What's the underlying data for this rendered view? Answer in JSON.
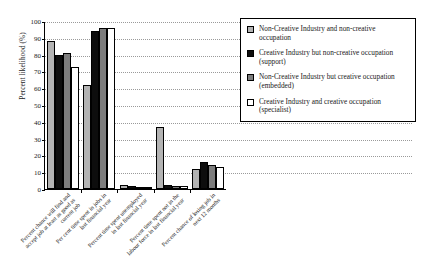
{
  "chart_data": {
    "type": "bar",
    "title": "",
    "xlabel": "",
    "ylabel": "Percent likelihood (%)",
    "ylim": [
      0,
      100
    ],
    "yticks": [
      0,
      10,
      20,
      30,
      40,
      50,
      60,
      70,
      80,
      90,
      100
    ],
    "grid": true,
    "legend_position": "right",
    "categories": [
      "Percent chance will find and accept job at least as good as current job",
      "Per cent time spent in jobs in last financial year",
      "Percent time spent unemployed in last financial year",
      "Percent time spent not in the labour force in last financial year",
      "Percent chance of losing job in next 12 months"
    ],
    "series": [
      {
        "name": "Non-Creative Industry and non-creative occupation",
        "color": "#b3b3b3",
        "values": [
          88,
          62,
          2.5,
          37,
          12
        ]
      },
      {
        "name": "Creative Industry but non-creative occupation (support)",
        "color": "#0d0d0d",
        "values": [
          80,
          94,
          2,
          2.5,
          16
        ]
      },
      {
        "name": "Non-Creative Industry but creative occupation (embedded)",
        "color": "#7d7d7d",
        "values": [
          81,
          96,
          1,
          1.5,
          14
        ]
      },
      {
        "name": "Creative Industry and creative occupation (specialist)",
        "color": "#ffffff",
        "values": [
          72.5,
          96,
          1.2,
          2,
          13
        ]
      }
    ]
  },
  "legend": {
    "items": [
      {
        "label": "Non-Creative Industry and non-creative occupation",
        "swatch": "#b3b3b3"
      },
      {
        "label": "Creative Industry but non-creative occupation (support)",
        "swatch": "#0d0d0d"
      },
      {
        "label": "Non-Creative Industry but creative occupation (embedded)",
        "swatch": "#7d7d7d"
      },
      {
        "label": "Creative Industry and creative occupation (specialist)",
        "swatch": "#ffffff"
      }
    ]
  }
}
